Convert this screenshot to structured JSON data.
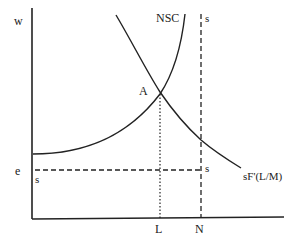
{
  "diagram": {
    "type": "economics-labor-market",
    "labels": {
      "y_axis": "w",
      "x_axis_L": "L",
      "x_axis_N": "N",
      "nsc_curve": "NSC",
      "demand_curve": "sF'(L/M)",
      "equilibrium_point": "A",
      "wage_level": "e",
      "supply_top": "s",
      "supply_corner": "s",
      "supply_left": "s"
    },
    "elements": [
      {
        "id": "nsc",
        "kind": "curve",
        "shape": "convex upward-sloping",
        "label": "NSC"
      },
      {
        "id": "demand",
        "kind": "curve",
        "shape": "convex downward-sloping",
        "label": "sF'(L/M)"
      },
      {
        "id": "supply-vertical",
        "kind": "dashed line",
        "orientation": "vertical",
        "at": "N"
      },
      {
        "id": "supply-horizontal",
        "kind": "dashed line",
        "orientation": "horizontal",
        "at": "e"
      },
      {
        "id": "drop-L",
        "kind": "dotted line",
        "from": "A",
        "to": "L"
      }
    ]
  }
}
